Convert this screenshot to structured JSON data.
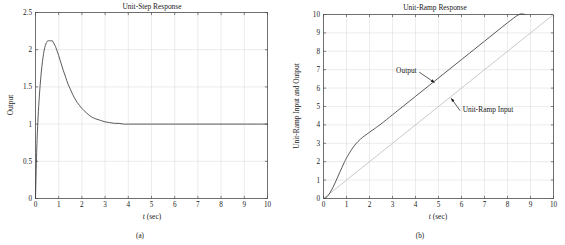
{
  "figure": {
    "panels": [
      {
        "id": "a",
        "caption": "(a)",
        "title": "Unit-Step Response",
        "xlabel_italic": "t",
        "xlabel_rest": " (sec)",
        "ylabel": "Output"
      },
      {
        "id": "b",
        "caption": "(b)",
        "title": "Unit-Ramp Response",
        "xlabel_italic": "t",
        "xlabel_rest": " (sec)",
        "ylabel": "Unit-Ramp Input and Output",
        "annotations": [
          {
            "text": "Output"
          },
          {
            "text": "Unit-Ramp Input"
          }
        ]
      }
    ]
  },
  "chart_data": [
    {
      "type": "line",
      "panel": "a",
      "title": "Unit-Step Response",
      "xlabel": "t (sec)",
      "ylabel": "Output",
      "xlim": [
        0,
        10
      ],
      "ylim": [
        0,
        2.5
      ],
      "xticks": [
        "0",
        "1",
        "2",
        "3",
        "4",
        "5",
        "6",
        "7",
        "8",
        "9",
        "10"
      ],
      "yticks": [
        "0",
        "0.5",
        "1",
        "1.5",
        "2",
        "2.5"
      ],
      "grid": true,
      "legend": "none",
      "series": [
        {
          "name": "Output",
          "color": "#3c3c3c",
          "x": [
            0.0,
            0.05,
            0.1,
            0.15,
            0.2,
            0.25,
            0.3,
            0.35,
            0.4,
            0.45,
            0.5,
            0.55,
            0.6,
            0.65,
            0.7,
            0.73,
            0.8,
            0.85,
            0.9,
            1.0,
            1.1,
            1.2,
            1.3,
            1.4,
            1.5,
            1.6,
            1.7,
            1.8,
            1.9,
            2.0,
            2.2,
            2.4,
            2.6,
            2.8,
            3.0,
            3.2,
            3.4,
            3.6,
            3.8,
            4.0,
            4.5,
            5.0,
            6.0,
            7.0,
            8.0,
            9.0,
            10.0
          ],
          "y": [
            0.0,
            0.62,
            1.02,
            1.3,
            1.52,
            1.7,
            1.84,
            1.95,
            2.03,
            2.08,
            2.11,
            2.12,
            2.12,
            2.12,
            2.12,
            2.12,
            2.08,
            2.05,
            2.01,
            1.92,
            1.82,
            1.72,
            1.63,
            1.54,
            1.47,
            1.4,
            1.34,
            1.29,
            1.25,
            1.21,
            1.15,
            1.1,
            1.07,
            1.05,
            1.03,
            1.02,
            1.01,
            1.01,
            1.0,
            1.0,
            1.0,
            1.0,
            1.0,
            1.0,
            1.0,
            1.0,
            1.0
          ]
        }
      ]
    },
    {
      "type": "line",
      "panel": "b",
      "title": "Unit-Ramp Response",
      "xlabel": "t (sec)",
      "ylabel": "Unit-Ramp Input and Output",
      "xlim": [
        0,
        10
      ],
      "ylim": [
        0,
        10
      ],
      "xticks": [
        "0",
        "1",
        "2",
        "3",
        "4",
        "5",
        "6",
        "7",
        "8",
        "9",
        "10"
      ],
      "yticks": [
        "0",
        "1",
        "2",
        "3",
        "4",
        "5",
        "6",
        "7",
        "8",
        "9",
        "10"
      ],
      "grid": true,
      "legend": "annotations",
      "series": [
        {
          "name": "Unit-Ramp Input",
          "color": "#c9c9c9",
          "x": [
            0,
            10
          ],
          "y": [
            0,
            10
          ]
        },
        {
          "name": "Output",
          "color": "#3c3c3c",
          "x": [
            0.0,
            0.1,
            0.2,
            0.3,
            0.4,
            0.5,
            0.6,
            0.7,
            0.8,
            0.9,
            1.0,
            1.2,
            1.4,
            1.6,
            1.8,
            2.0,
            2.25,
            2.5,
            3.0,
            3.5,
            4.0,
            4.5,
            5.0,
            5.5,
            6.0,
            6.5,
            7.0,
            7.5,
            8.0,
            8.5,
            8.75
          ],
          "y": [
            0.0,
            0.04,
            0.16,
            0.35,
            0.58,
            0.84,
            1.12,
            1.4,
            1.68,
            1.95,
            2.2,
            2.62,
            2.96,
            3.22,
            3.42,
            3.6,
            3.82,
            4.05,
            4.55,
            5.05,
            5.55,
            6.05,
            6.55,
            7.05,
            7.55,
            8.05,
            8.55,
            9.05,
            9.55,
            10.0,
            10.0
          ]
        }
      ],
      "annotations": [
        {
          "text": "Output",
          "label_x": 4.05,
          "label_y": 6.95,
          "tip_x": 4.83,
          "tip_y": 6.3
        },
        {
          "text": "Unit-Ramp Input",
          "label_x": 6.05,
          "label_y": 4.85,
          "tip_x": 5.55,
          "tip_y": 5.45
        }
      ]
    }
  ]
}
